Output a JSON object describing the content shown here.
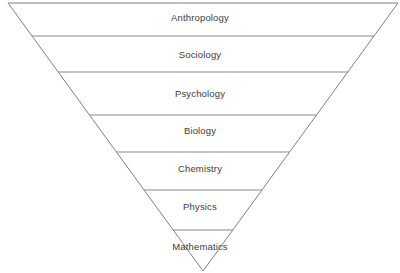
{
  "diagram": {
    "type": "inverted-pyramid",
    "orientation": "inverted",
    "background_color": "#ffffff",
    "outline_color": "#808080",
    "divider_color": "#8a8a8a",
    "text_color": "#3b3b3b",
    "apex": {
      "x": 203,
      "y": 271
    },
    "top_left": {
      "x": 8,
      "y": 3
    },
    "top_right": {
      "x": 398,
      "y": 3
    },
    "tiers": [
      {
        "label": "Anthropology",
        "index": 1,
        "label_y": 13,
        "divider_y": 36
      },
      {
        "label": "Sociology",
        "index": 2,
        "label_y": 50,
        "divider_y": 72
      },
      {
        "label": "Psychology",
        "index": 3,
        "label_y": 89,
        "divider_y": 115
      },
      {
        "label": "Biology",
        "index": 4,
        "label_y": 126,
        "divider_y": 152
      },
      {
        "label": "Chemistry",
        "index": 5,
        "label_y": 164,
        "divider_y": 190
      },
      {
        "label": "Physics",
        "index": 6,
        "label_y": 202,
        "divider_y": 230
      },
      {
        "label": "Mathematics",
        "index": 7,
        "label_y": 242,
        "divider_y": null
      }
    ]
  }
}
